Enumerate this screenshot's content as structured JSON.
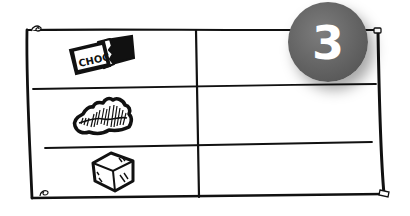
{
  "badge": {
    "number": "3",
    "color": "#666666",
    "text_color": "#ffffff"
  },
  "table": {
    "columns": 2,
    "rows": [
      {
        "icon": "chocolate-bar-icon",
        "icon_label": "CHOC",
        "value": ""
      },
      {
        "icon": "brownie-chunk-icon",
        "icon_label": "",
        "value": ""
      },
      {
        "icon": "sugar-cube-icon",
        "icon_label": "",
        "value": ""
      }
    ],
    "line_color": "#111111"
  },
  "pins": [
    "top-left-pin-icon",
    "top-right-pin-icon",
    "bottom-left-pin-icon",
    "bottom-right-pin-icon"
  ]
}
